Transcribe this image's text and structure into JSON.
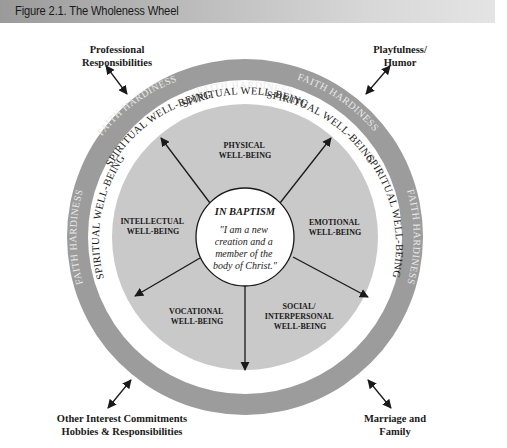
{
  "figure": {
    "title": "Figure 2.1. The Wholeness Wheel"
  },
  "wheel": {
    "colors": {
      "outer_ring": "#999999",
      "spiritual_ring": "#ffffff",
      "inner_disc": "#c8c8c8",
      "center": "#ffffff",
      "text_dark": "#1a1a1a",
      "text_light": "#e8e8e8"
    },
    "outer_ring_label": "FAITH HARDINESS",
    "spiritual_ring_label": "SPIRITUAL WELL-BEING",
    "center": {
      "heading": "IN BAPTISM",
      "quote_lines": [
        "\"I am a new",
        "creation and a",
        "member of the",
        "body of Christ.\""
      ]
    },
    "segments": [
      {
        "id": "physical",
        "lines": [
          "PHYSICAL",
          "WELL-BEING"
        ]
      },
      {
        "id": "emotional",
        "lines": [
          "EMOTIONAL",
          "WELL-BEING"
        ]
      },
      {
        "id": "social",
        "lines": [
          "SOCIAL/",
          "INTERPERSONAL",
          "WELL-BEING"
        ]
      },
      {
        "id": "vocational",
        "lines": [
          "VOCATIONAL",
          "WELL-BEING"
        ]
      },
      {
        "id": "intellectual",
        "lines": [
          "INTELLECTUAL",
          "WELL-BEING"
        ]
      }
    ]
  },
  "corners": {
    "top_left": {
      "line1": "Professional",
      "line2": "Responsibilities"
    },
    "top_right": {
      "line1": "Playfulness/",
      "line2": "Humor"
    },
    "bottom_left": {
      "line1": "Other Interest Commitments",
      "line2": "Hobbies & Responsibilities"
    },
    "bottom_right": {
      "line1": "Marriage and",
      "line2": "Family"
    }
  }
}
